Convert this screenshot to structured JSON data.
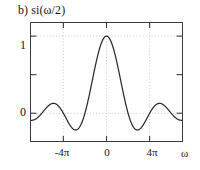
{
  "figure": {
    "title": "b) si(ω/2)",
    "background": "#ffffff",
    "frame_color": "#3a3a3e",
    "curve_color": "#2b2b30",
    "grid_color": "#b9b9bd"
  },
  "chart_data": {
    "type": "line",
    "title": "b) si(ω/2)",
    "xlabel": "ω",
    "ylabel": "",
    "grid": true,
    "grid_style": "dotted",
    "legend": null,
    "xlim": [
      -7.0,
      7.0
    ],
    "ylim": [
      -0.36,
      1.17
    ],
    "xtick_values": [
      -4,
      0,
      4
    ],
    "xtick_labels": [
      "-4π",
      "0",
      "4π"
    ],
    "xtick_unit": "pi",
    "ytick_values": [
      0,
      0.5,
      1
    ],
    "ytick_labels": [
      "0",
      "",
      "1"
    ],
    "gridlines_x": [
      -4,
      0,
      4
    ],
    "gridlines_y": [
      0,
      1
    ],
    "function": "si(w/2) = sin(w/2)/(w/2)",
    "x": [
      -7.0,
      -6.5,
      -6.0,
      -5.5,
      -5.0,
      -4.5,
      -4.0,
      -3.5,
      -3.0,
      -2.5,
      -2.0,
      -1.5,
      -1.0,
      -0.5,
      0.0,
      0.5,
      1.0,
      1.5,
      2.0,
      2.5,
      3.0,
      3.5,
      4.0,
      4.5,
      5.0,
      5.5,
      6.0,
      6.5,
      7.0
    ],
    "x_unit": "pi",
    "values": [
      -0.091,
      -0.031,
      0.0,
      0.058,
      0.127,
      0.13,
      0.0,
      -0.164,
      -0.212,
      -0.093,
      0.0,
      0.212,
      0.637,
      0.9,
      1.0,
      0.9,
      0.637,
      0.212,
      0.0,
      -0.093,
      -0.212,
      -0.164,
      0.0,
      0.13,
      0.127,
      0.058,
      0.0,
      -0.031,
      -0.091
    ],
    "peak": {
      "x": 0,
      "y": 1
    },
    "zeros_x_pi": [
      -6,
      -4,
      -2,
      2,
      4,
      6
    ],
    "sidelobe_minima": -0.217,
    "sidelobe_maxima": 0.128
  },
  "axes": {
    "y_ticks": [
      {
        "label": "1",
        "value": 1
      },
      {
        "label": "",
        "value": 0.5
      },
      {
        "label": "0",
        "value": 0
      }
    ],
    "x_ticks": [
      {
        "label": "-4π",
        "value": -4
      },
      {
        "label": "0",
        "value": 0
      },
      {
        "label": "4π",
        "value": 4
      }
    ],
    "x_axis_name": "ω"
  }
}
